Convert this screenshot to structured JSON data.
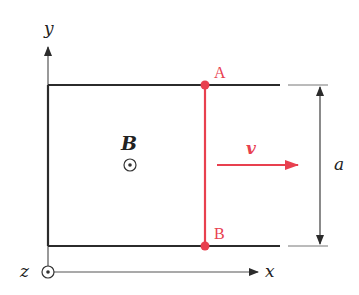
{
  "diagram": {
    "type": "physics-schematic",
    "colors": {
      "rails": "#2b2b2b",
      "rod": "#e8404f",
      "axes": "#333333",
      "labels": "#222222",
      "rod_labels": "#e8404f"
    },
    "axes": {
      "x_label": "x",
      "y_label": "y",
      "z_label": "z",
      "z_symbol": "out-of-page (dot in circle)"
    },
    "field": {
      "label": "B",
      "symbol": "out-of-page (dot in circle)"
    },
    "rod": {
      "top_point_label": "A",
      "bottom_point_label": "B"
    },
    "velocity": {
      "label": "v",
      "direction": "+x"
    },
    "dimension": {
      "label": "a",
      "spans": "distance between rails"
    }
  }
}
